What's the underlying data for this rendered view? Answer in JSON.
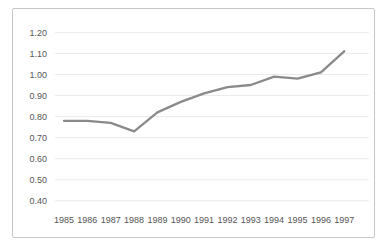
{
  "chart": {
    "panel_border_color": "#c6c6c6",
    "grid_color": "#eaeaea",
    "line_color": "#8a8a8a",
    "tick_text_color": "#555555",
    "background_color": "#ffffff"
  },
  "chart_data": {
    "type": "line",
    "title": "",
    "xlabel": "",
    "ylabel": "",
    "categories": [
      "1985",
      "1986",
      "1987",
      "1988",
      "1989",
      "1990",
      "1991",
      "1992",
      "1993",
      "1994",
      "1995",
      "1996",
      "1997"
    ],
    "series": [
      {
        "name": "ratio",
        "values": [
          0.78,
          0.78,
          0.77,
          0.73,
          0.82,
          0.87,
          0.91,
          0.94,
          0.95,
          0.99,
          0.98,
          1.01,
          1.11
        ]
      }
    ],
    "ylim": [
      0.4,
      1.2
    ],
    "ytick_step": 0.1,
    "ytick_labels": [
      "1.20",
      "1.10",
      "1.00",
      "0.90",
      "0.80",
      "0.70",
      "0.60",
      "0.50",
      "0.40"
    ],
    "grid": "horizontal-only",
    "legend": "none",
    "markers": "none"
  }
}
